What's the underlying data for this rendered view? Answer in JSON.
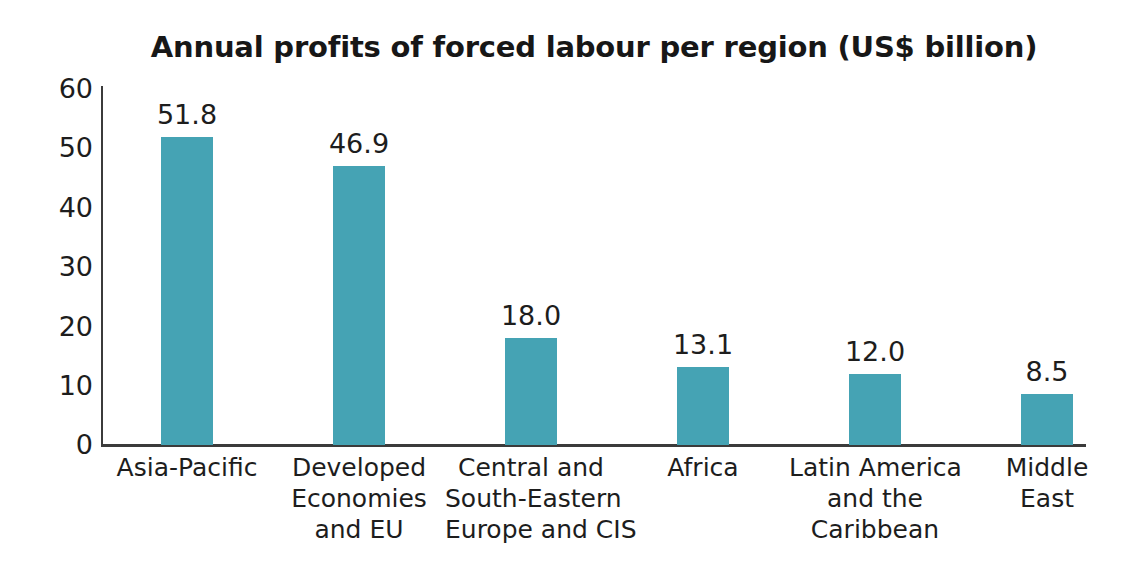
{
  "chart_data": {
    "type": "bar",
    "title": "Annual profits of forced labour per region (US$ billion)",
    "xlabel": "",
    "ylabel": "",
    "ylim": [
      0,
      60
    ],
    "yticks": [
      "60",
      "50",
      "40",
      "30",
      "20",
      "10",
      "0"
    ],
    "grid": false,
    "legend": null,
    "bar_color": "#45a3b4",
    "text_color": "#1d1d1d",
    "axis_color": "#3b3b3b",
    "categories": [
      "Asia-Pacific",
      "Developed Economies and EU",
      "Central and South-Eastern Europe and CIS",
      "Africa",
      "Latin America and the Caribbean",
      "Middle East"
    ],
    "category_lines": [
      [
        "Asia-Pacific"
      ],
      [
        "Developed",
        "Economies",
        "and EU"
      ],
      [
        "Central and",
        "South-Eastern",
        "Europe and CIS"
      ],
      [
        "Africa"
      ],
      [
        "Latin America",
        "and the",
        "Caribbean"
      ],
      [
        "Middle",
        "East"
      ]
    ],
    "values": [
      51.8,
      46.9,
      18.0,
      13.1,
      12.0,
      8.5
    ],
    "value_labels": [
      "51.8",
      "46.9",
      "18.0",
      "13.1",
      "12.0",
      "8.5"
    ]
  }
}
